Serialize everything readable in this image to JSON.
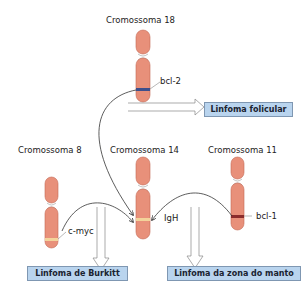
{
  "chromosomes": {
    "chr18": {
      "label": "Cromossoma 18",
      "gene": "bcl-2",
      "band_color": "#3e4f8c"
    },
    "chr8": {
      "label": "Cromossoma 8",
      "gene": "c-myc",
      "band_color": "#f3d39a"
    },
    "chr14": {
      "label": "Cromossoma 14",
      "gene": "IgH",
      "band_color": "#f3d39a"
    },
    "chr11": {
      "label": "Cromossoma 11",
      "gene": "bcl-1",
      "band_color": "#8b2c2c"
    }
  },
  "outcomes": {
    "follicular": "Linfoma folicular",
    "burkitt": "Linfoma de Burkitt",
    "mantle": "Linfoma da zona do manto"
  },
  "colors": {
    "chromosome_fill": "#e8907a",
    "chromosome_stroke": "#c46a55",
    "box_fill": "#b9d4ee",
    "box_border": "#7f97b2"
  }
}
